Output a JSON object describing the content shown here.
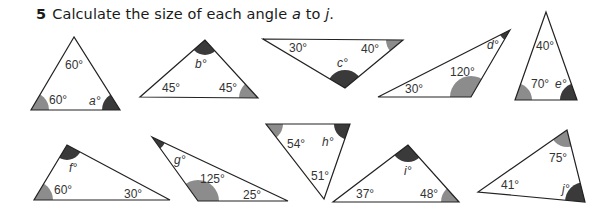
{
  "question": {
    "number": "5",
    "text_before": "Calculate the size of each angle ",
    "var_start": "a",
    "text_mid": " to ",
    "var_end": "j",
    "text_after": "."
  },
  "colors": {
    "known_angle": "#8c8c8c",
    "unknown_angle": "#3a3a3a",
    "outline": "#222222",
    "text": "#333333"
  },
  "triangles": [
    {
      "id": "a",
      "labels": [
        "60°",
        "60°",
        "a°"
      ]
    },
    {
      "id": "b",
      "labels": [
        "b°",
        "45°",
        "45°"
      ]
    },
    {
      "id": "c",
      "labels": [
        "30°",
        "40°",
        "c°"
      ]
    },
    {
      "id": "d",
      "labels": [
        "d°",
        "120°",
        "30°"
      ]
    },
    {
      "id": "e",
      "labels": [
        "40°",
        "70°",
        "e°"
      ]
    },
    {
      "id": "f",
      "labels": [
        "f°",
        "60°",
        "30°"
      ]
    },
    {
      "id": "g",
      "labels": [
        "g°",
        "125°",
        "25°"
      ]
    },
    {
      "id": "h",
      "labels": [
        "54°",
        "h°",
        "51°"
      ]
    },
    {
      "id": "i",
      "labels": [
        "i°",
        "37°",
        "48°"
      ]
    },
    {
      "id": "j",
      "labels": [
        "75°",
        "41°",
        "j°"
      ]
    }
  ]
}
